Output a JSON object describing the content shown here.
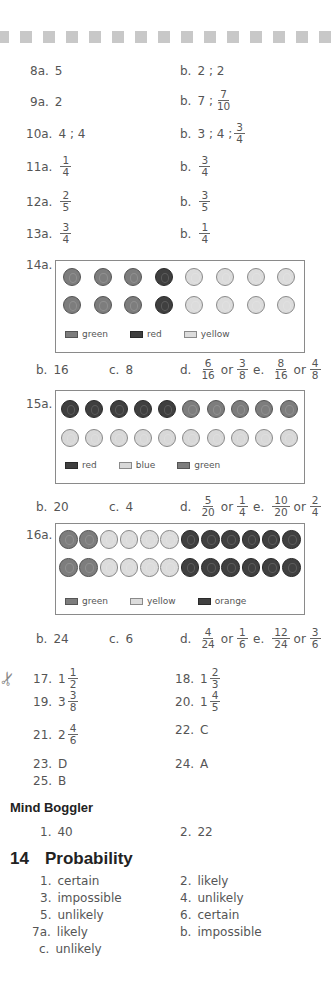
{
  "answers": {
    "q8": {
      "a": "8a.",
      "a_val": "5",
      "b": "b.",
      "b_val": "2 ; 2"
    },
    "q9": {
      "a": "9a.",
      "a_val": "2",
      "b": "b.",
      "b_val": "7 ;",
      "b_frac": {
        "num": "7",
        "den": "10"
      }
    },
    "q10": {
      "a": "10a.",
      "a_val": "4 ; 4",
      "b": "b.",
      "b_val": "3 ; 4 ;",
      "b_frac": {
        "num": "3",
        "den": "4"
      }
    },
    "q11": {
      "a": "11a.",
      "a_frac": {
        "num": "1",
        "den": "4"
      },
      "b": "b.",
      "b_frac": {
        "num": "3",
        "den": "4"
      }
    },
    "q12": {
      "a": "12a.",
      "a_frac": {
        "num": "2",
        "den": "5"
      },
      "b": "b.",
      "b_frac": {
        "num": "3",
        "den": "5"
      }
    },
    "q13": {
      "a": "13a.",
      "a_frac": {
        "num": "3",
        "den": "4"
      },
      "b": "b.",
      "b_frac": {
        "num": "1",
        "den": "4"
      }
    },
    "q14": {
      "a": "14a.",
      "legend": [
        "green",
        "red",
        "yellow"
      ],
      "b": "b.",
      "b_val": "16",
      "c": "c.",
      "c_val": "8",
      "d": "d.",
      "d_frac1": {
        "num": "6",
        "den": "16"
      },
      "d_frac2": {
        "num": "3",
        "den": "8"
      },
      "e": "e.",
      "e_frac1": {
        "num": "8",
        "den": "16"
      },
      "e_frac2": {
        "num": "4",
        "den": "8"
      },
      "or": "or"
    },
    "q15": {
      "a": "15a.",
      "legend": [
        "red",
        "blue",
        "green"
      ],
      "b": "b.",
      "b_val": "20",
      "c": "c.",
      "c_val": "4",
      "d": "d.",
      "d_frac1": {
        "num": "5",
        "den": "20"
      },
      "d_frac2": {
        "num": "1",
        "den": "4"
      },
      "e": "e.",
      "e_frac1": {
        "num": "10",
        "den": "20"
      },
      "e_frac2": {
        "num": "2",
        "den": "4"
      },
      "or": "or"
    },
    "q16": {
      "a": "16a.",
      "legend": [
        "green",
        "yellow",
        "orange"
      ],
      "b": "b.",
      "b_val": "24",
      "c": "c.",
      "c_val": "6",
      "d": "d.",
      "d_frac1": {
        "num": "4",
        "den": "24"
      },
      "d_frac2": {
        "num": "1",
        "den": "6"
      },
      "e": "e.",
      "e_frac1": {
        "num": "12",
        "den": "24"
      },
      "e_frac2": {
        "num": "3",
        "den": "6"
      },
      "or": "or"
    },
    "q17": {
      "label": "17.",
      "whole": "1",
      "frac": {
        "num": "1",
        "den": "2"
      }
    },
    "q18": {
      "label": "18.",
      "whole": "1",
      "frac": {
        "num": "2",
        "den": "3"
      }
    },
    "q19": {
      "label": "19.",
      "whole": "3",
      "frac": {
        "num": "3",
        "den": "8"
      }
    },
    "q20": {
      "label": "20.",
      "whole": "1",
      "frac": {
        "num": "4",
        "den": "5"
      }
    },
    "q21": {
      "label": "21.",
      "whole": "2",
      "frac": {
        "num": "4",
        "den": "6"
      }
    },
    "q22": {
      "label": "22.",
      "val": "C"
    },
    "q23": {
      "label": "23.",
      "val": "D"
    },
    "q24": {
      "label": "24.",
      "val": "A"
    },
    "q25": {
      "label": "25.",
      "val": "B"
    }
  },
  "mind_boggler": {
    "title": "Mind Boggler",
    "items": [
      {
        "label": "1.",
        "val": "40"
      },
      {
        "label": "2.",
        "val": "22"
      }
    ]
  },
  "probability": {
    "number": "14",
    "title": "Probability",
    "items": [
      {
        "label": "1.",
        "val": "certain"
      },
      {
        "label": "2.",
        "val": "likely"
      },
      {
        "label": "3.",
        "val": "impossible"
      },
      {
        "label": "4.",
        "val": "unlikely"
      },
      {
        "label": "5.",
        "val": "unlikely"
      },
      {
        "label": "6.",
        "val": "certain"
      },
      {
        "label": "7a.",
        "val": "likely"
      },
      {
        "label": "b.",
        "val": "impossible"
      },
      {
        "label": "c.",
        "val": "unlikely"
      }
    ]
  },
  "colors": {
    "text": "#555555",
    "heading": "#222222",
    "dash": "#c8c8c8",
    "box_border": "#8a8a8a"
  }
}
